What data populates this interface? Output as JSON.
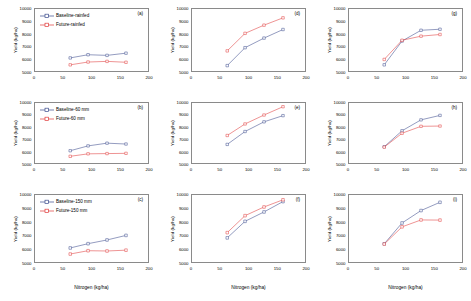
{
  "figure": {
    "axis": {
      "xlabel": "Nitrogen (kg/ha)",
      "ylabel": "Yield (kg/ha)",
      "xticks": [
        "0",
        "50",
        "100",
        "150",
        "200"
      ],
      "yticks": [
        "5000",
        "6000",
        "7000",
        "8000",
        "9000",
        "10000"
      ],
      "xlim": [
        0,
        200
      ],
      "ylim": [
        5000,
        10000
      ]
    },
    "colors": {
      "baseline": "#3a4a8c",
      "future": "#e03a3a",
      "frame": "#8a8a8a",
      "text": "#000000"
    }
  },
  "chart_data": [
    {
      "type": "line",
      "panel": "(a)",
      "xlabel": "Nitrogen (kg/ha)",
      "ylabel": "Yield (kg/ha)",
      "xlim": [
        0,
        200
      ],
      "ylim": [
        5000,
        10000
      ],
      "x": [
        63,
        94,
        127,
        160
      ],
      "legend_position": "top-left",
      "series": [
        {
          "name": "Baseline-rainfed",
          "color": "#3a4a8c",
          "values": [
            6100,
            6350,
            6300,
            6470
          ]
        },
        {
          "name": "Future-rainfed",
          "color": "#e03a3a",
          "values": [
            5560,
            5780,
            5830,
            5760
          ]
        }
      ]
    },
    {
      "type": "line",
      "panel": "(b)",
      "xlabel": "Nitrogen (kg/ha)",
      "ylabel": "Yield (kg/ha)",
      "xlim": [
        0,
        200
      ],
      "ylim": [
        5000,
        10000
      ],
      "x": [
        63,
        94,
        127,
        160
      ],
      "legend_position": "top-left",
      "series": [
        {
          "name": "Baseline-60 mm",
          "color": "#3a4a8c",
          "values": [
            6070,
            6460,
            6680,
            6610
          ]
        },
        {
          "name": "Future-60 mm",
          "color": "#e03a3a",
          "values": [
            5620,
            5820,
            5840,
            5860
          ]
        }
      ]
    },
    {
      "type": "line",
      "panel": "(c)",
      "xlabel": "Nitrogen (kg/ha)",
      "ylabel": "Yield (kg/ha)",
      "xlim": [
        0,
        200
      ],
      "ylim": [
        5000,
        10000
      ],
      "x": [
        63,
        94,
        127,
        160
      ],
      "legend_position": "top-left",
      "series": [
        {
          "name": "Baseline-150 mm",
          "color": "#3a4a8c",
          "values": [
            6090,
            6400,
            6670,
            7000
          ]
        },
        {
          "name": "Future-150 mm",
          "color": "#e03a3a",
          "values": [
            5650,
            5890,
            5870,
            5930
          ]
        }
      ]
    },
    {
      "type": "line",
      "panel": "(d)",
      "xlabel": "Nitrogen (kg/ha)",
      "ylabel": "Yield (kg/ha)",
      "xlim": [
        0,
        200
      ],
      "ylim": [
        5000,
        10000
      ],
      "x": [
        63,
        94,
        127,
        160
      ],
      "legend_position": "none",
      "series": [
        {
          "name": "Baseline-rainfed",
          "color": "#3a4a8c",
          "values": [
            5500,
            6900,
            7650,
            8320
          ]
        },
        {
          "name": "Future-rainfed",
          "color": "#e03a3a",
          "values": [
            6650,
            8020,
            8660,
            9230
          ]
        }
      ]
    },
    {
      "type": "line",
      "panel": "(e)",
      "xlabel": "Nitrogen (kg/ha)",
      "ylabel": "Yield (kg/ha)",
      "xlim": [
        0,
        200
      ],
      "ylim": [
        5000,
        10000
      ],
      "x": [
        63,
        94,
        127,
        160
      ],
      "legend_position": "none",
      "series": [
        {
          "name": "Baseline-60 mm",
          "color": "#3a4a8c",
          "values": [
            6580,
            7620,
            8400,
            8900
          ]
        },
        {
          "name": "Future-60 mm",
          "color": "#e03a3a",
          "values": [
            7300,
            8230,
            8950,
            9620
          ]
        }
      ]
    },
    {
      "type": "line",
      "panel": "(f)",
      "xlabel": "Nitrogen (kg/ha)",
      "ylabel": "Yield (kg/ha)",
      "xlim": [
        0,
        200
      ],
      "ylim": [
        5000,
        10000
      ],
      "x": [
        63,
        94,
        127,
        160
      ],
      "legend_position": "none",
      "series": [
        {
          "name": "Baseline-150 mm",
          "color": "#3a4a8c",
          "values": [
            6820,
            8020,
            8700,
            9450
          ]
        },
        {
          "name": "Future-150 mm",
          "color": "#e03a3a",
          "values": [
            7200,
            8430,
            9060,
            9580
          ]
        }
      ]
    },
    {
      "type": "line",
      "panel": "(g)",
      "xlabel": "Nitrogen (kg/ha)",
      "ylabel": "Yield (kg/ha)",
      "xlim": [
        0,
        200
      ],
      "ylim": [
        5000,
        10000
      ],
      "x": [
        63,
        94,
        127,
        160
      ],
      "legend_position": "none",
      "series": [
        {
          "name": "Baseline-rainfed",
          "color": "#3a4a8c",
          "values": [
            5560,
            7420,
            8260,
            8340
          ]
        },
        {
          "name": "Future-rainfed",
          "color": "#e03a3a",
          "values": [
            5980,
            7480,
            7800,
            7930
          ]
        }
      ]
    },
    {
      "type": "line",
      "panel": "(h)",
      "xlabel": "Nitrogen (kg/ha)",
      "ylabel": "Yield (kg/ha)",
      "xlim": [
        0,
        200
      ],
      "ylim": [
        5000,
        10000
      ],
      "x": [
        63,
        94,
        127,
        160
      ],
      "legend_position": "none",
      "series": [
        {
          "name": "Baseline-60 mm",
          "color": "#3a4a8c",
          "values": [
            6390,
            7680,
            8560,
            8920
          ]
        },
        {
          "name": "Future-60 mm",
          "color": "#e03a3a",
          "values": [
            6360,
            7480,
            8040,
            8060
          ]
        }
      ]
    },
    {
      "type": "line",
      "panel": "(i)",
      "xlabel": "Nitrogen (kg/ha)",
      "ylabel": "Yield (kg/ha)",
      "xlim": [
        0,
        200
      ],
      "ylim": [
        5000,
        10000
      ],
      "x": [
        63,
        94,
        127,
        160
      ],
      "legend_position": "none",
      "series": [
        {
          "name": "Baseline-150 mm",
          "color": "#3a4a8c",
          "values": [
            6390,
            7900,
            8800,
            9400
          ]
        },
        {
          "name": "Future-150 mm",
          "color": "#e03a3a",
          "values": [
            6370,
            7620,
            8120,
            8110
          ]
        }
      ]
    }
  ]
}
